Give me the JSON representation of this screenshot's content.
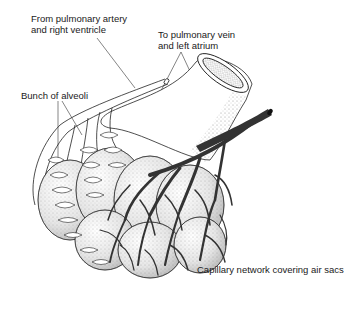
{
  "diagram": {
    "labels": {
      "artery_line1": "From pulmonary artery",
      "artery_line2": "and right ventricle",
      "vein_line1": "To pulmonary vein",
      "vein_line2": "and left atrium",
      "alveoli": "Bunch of alveoli",
      "capillary": "Capillary network covering air sacs"
    },
    "colors": {
      "ink": "#1a1a1a",
      "vein_fill": "#3a3a3a",
      "artery_outline": "#2a2a2a",
      "stipple": "#9a9a9a",
      "background": "#ffffff"
    }
  }
}
